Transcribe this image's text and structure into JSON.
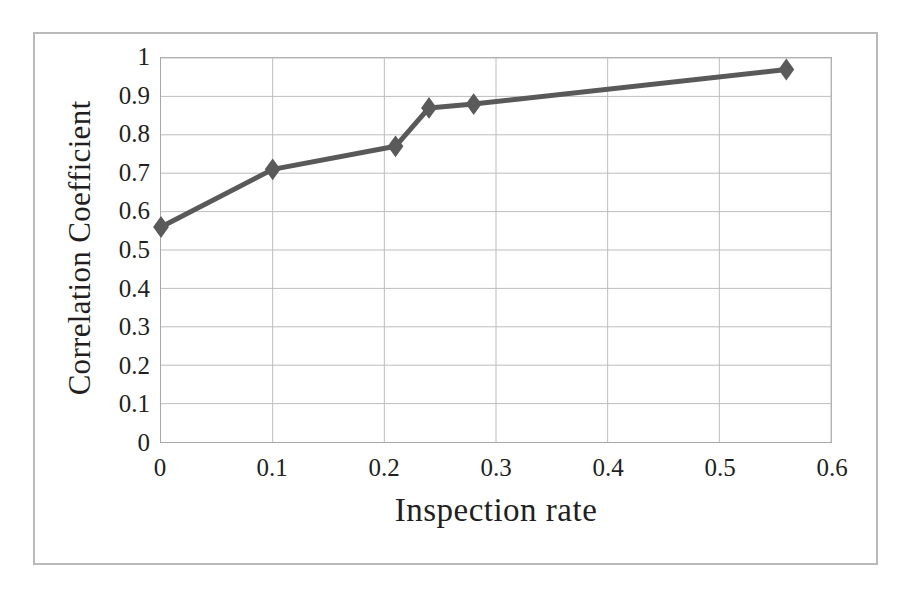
{
  "chart_data": {
    "type": "line",
    "title": "",
    "subtitle": "",
    "xlabel": "Inspection rate",
    "ylabel": "Correlation Coefficient",
    "xlim": [
      0,
      0.6
    ],
    "ylim": [
      0,
      1
    ],
    "grid": true,
    "legend": false,
    "legend_position": "none",
    "marker": "diamond",
    "series_color": "#595959",
    "x": [
      0,
      0.1,
      0.21,
      0.24,
      0.28,
      0.56
    ],
    "series": [
      {
        "name": "Correlation Coefficient",
        "values": [
          0.56,
          0.71,
          0.77,
          0.87,
          0.88,
          0.97
        ]
      }
    ],
    "points": [
      {
        "x": 0,
        "y": 0.56
      },
      {
        "x": 0.1,
        "y": 0.71
      },
      {
        "x": 0.21,
        "y": 0.77
      },
      {
        "x": 0.24,
        "y": 0.87
      },
      {
        "x": 0.28,
        "y": 0.88
      },
      {
        "x": 0.56,
        "y": 0.97
      }
    ],
    "xticks": [
      "0",
      "0.1",
      "0.2",
      "0.3",
      "0.4",
      "0.5",
      "0.6"
    ],
    "xtick_values": [
      0,
      0.1,
      0.2,
      0.3,
      0.4,
      0.5,
      0.6
    ],
    "yticks": [
      "0",
      "0.1",
      "0.2",
      "0.3",
      "0.4",
      "0.5",
      "0.6",
      "0.7",
      "0.8",
      "0.9",
      "1"
    ],
    "ytick_values": [
      0,
      0.1,
      0.2,
      0.3,
      0.4,
      0.5,
      0.6,
      0.7,
      0.8,
      0.9,
      1
    ],
    "colors": {
      "line": "#595959",
      "marker": "#5a5a5a",
      "grid": "#bdbdbd",
      "plot_border": "#a8a8a8",
      "figure_border": "#b9b9b9",
      "text": "#231f20",
      "background": "#ffffff"
    }
  }
}
